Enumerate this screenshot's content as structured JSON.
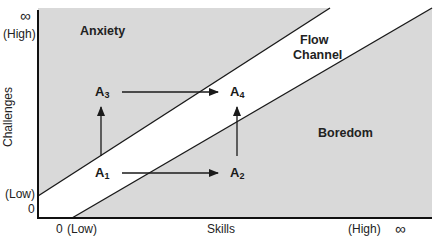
{
  "diagram": {
    "regions": {
      "anxiety": "Anxiety",
      "flow_line1": "Flow",
      "flow_line2": "Channel",
      "boredom": "Boredom"
    },
    "y_axis": {
      "label": "Challenges",
      "top_infinity": "∞",
      "high": "(High)",
      "low": "(Low)",
      "zero": "0"
    },
    "x_axis": {
      "label": "Skills",
      "zero": "0",
      "low": "(Low)",
      "high": "(High)",
      "right_infinity": "∞"
    },
    "points": [
      {
        "id": "A1",
        "base": "A",
        "sub": "1"
      },
      {
        "id": "A2",
        "base": "A",
        "sub": "2"
      },
      {
        "id": "A3",
        "base": "A",
        "sub": "3"
      },
      {
        "id": "A4",
        "base": "A",
        "sub": "4"
      }
    ],
    "arrows": [
      {
        "from": "A1",
        "to": "A2"
      },
      {
        "from": "A3",
        "to": "A4"
      },
      {
        "from": "A1",
        "to": "A3"
      },
      {
        "from": "A2",
        "to": "A4"
      }
    ],
    "colors": {
      "region_fill": "#d9d9d9",
      "channel_fill": "#ffffff",
      "line": "#1a1a1a"
    }
  }
}
